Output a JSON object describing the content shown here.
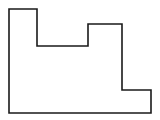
{
  "diagram": {
    "type": "rectilinear-polygon-outline",
    "canvas": {
      "width": 160,
      "height": 120,
      "background": "#ffffff"
    },
    "shape": {
      "stroke": "#1a1a1a",
      "stroke_width": 1.6,
      "fill": "#ffffff",
      "points": "9,9 37,9 37,46 88,46 88,24 122,24 122,90 151,90 151,113 9,113"
    }
  }
}
